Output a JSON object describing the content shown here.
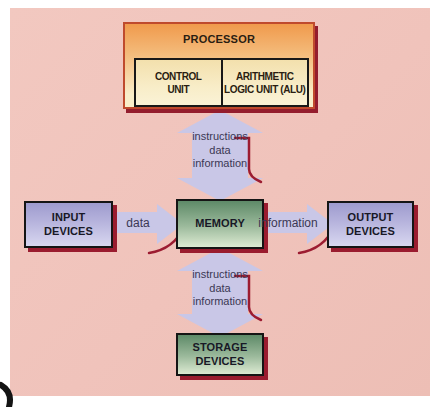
{
  "colors": {
    "panel_bg": "#f0c3bb",
    "box_border": "#151515",
    "box_shadow": "#9a1c2f",
    "arrow_fill": "#c9c7e7",
    "accent_red": "#9c1c31",
    "lavender_top": "#9e9bce",
    "lavender_bottom": "#d8d7f0",
    "green_top": "#5e8a68",
    "green_bottom": "#dcead2",
    "processor_border": "#bf4a2d",
    "processor_top": "#f09a4c",
    "processor_bottom": "#f9eec9",
    "subunit_fill": "#f8edc8"
  },
  "processor": {
    "title": "PROCESSOR",
    "subunits": [
      {
        "line1": "CONTROL",
        "line2": "UNIT"
      },
      {
        "line1": "ARITHMETIC",
        "line2": "LOGIC UNIT (ALU)"
      }
    ]
  },
  "nodes": {
    "input": {
      "line1": "INPUT",
      "line2": "DEVICES"
    },
    "memory": {
      "label": "MEMORY"
    },
    "output": {
      "line1": "OUTPUT",
      "line2": "DEVICES"
    },
    "storage": {
      "line1": "STORAGE",
      "line2": "DEVICES"
    }
  },
  "flows": {
    "processor_memory": {
      "line1": "instructions",
      "line2": "data",
      "line3": "information"
    },
    "input_memory": {
      "label": "data"
    },
    "memory_output": {
      "label": "information"
    },
    "memory_storage": {
      "line1": "instructions",
      "line2": "data",
      "line3": "information"
    }
  }
}
